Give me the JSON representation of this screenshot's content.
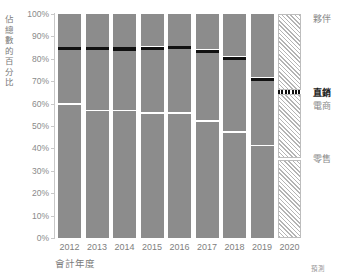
{
  "axes": {
    "y_title": "佔總數的百分比",
    "x_title": "會計年度",
    "y_ticks": [
      "100%",
      "90%",
      "80%",
      "70%",
      "60%",
      "50%",
      "40%",
      "30%",
      "20%",
      "10%",
      "0%"
    ],
    "x_ticks": [
      "2012",
      "2013",
      "2014",
      "2015",
      "2016",
      "2017",
      "2018",
      "2019",
      "2020"
    ],
    "forecast_note": "預測"
  },
  "legend": [
    {
      "key": "partner",
      "label": "夥伴",
      "bold": false
    },
    {
      "key": "direct",
      "label": "直銷",
      "bold": true
    },
    {
      "key": "ecommerce",
      "label": "電商",
      "bold": false
    },
    {
      "key": "retail",
      "label": "零售",
      "bold": false
    }
  ],
  "chart_data": {
    "type": "bar",
    "title": "",
    "xlabel": "會計年度",
    "ylabel": "佔總數的百分比",
    "ylim": [
      0,
      100
    ],
    "stacked": true,
    "grid": false,
    "legend_position": "right",
    "categories": [
      "2012",
      "2013",
      "2014",
      "2015",
      "2016",
      "2017",
      "2018",
      "2019",
      "2020"
    ],
    "series": [
      {
        "name": "零售",
        "values": [
          59.5,
          56.5,
          56.5,
          55.5,
          55.5,
          52.0,
          47.0,
          41.0,
          35.0
        ]
      },
      {
        "name": "電商",
        "values": [
          24.3,
          27.3,
          27.2,
          28.5,
          28.7,
          30.5,
          32.5,
          29.0,
          29.5
        ]
      },
      {
        "name": "直銷",
        "values": [
          1.4,
          1.4,
          1.4,
          1.4,
          1.4,
          1.4,
          1.4,
          1.4,
          1.4
        ]
      },
      {
        "name": "夥伴",
        "values": [
          14.8,
          14.8,
          14.9,
          14.6,
          14.4,
          16.1,
          19.1,
          28.6,
          34.1
        ]
      }
    ],
    "boundaries": {
      "retail_top": [
        59.5,
        56.5,
        56.5,
        55.5,
        55.5,
        52.0,
        47.0,
        41.0,
        35.0
      ],
      "direct_bottom": [
        83.8,
        83.8,
        83.7,
        84.0,
        84.2,
        82.5,
        79.5,
        70.0,
        64.5
      ],
      "direct_top": [
        85.2,
        85.2,
        85.1,
        85.4,
        85.6,
        83.9,
        80.9,
        71.4,
        65.9
      ]
    },
    "forecast_categories": [
      "2020"
    ]
  }
}
